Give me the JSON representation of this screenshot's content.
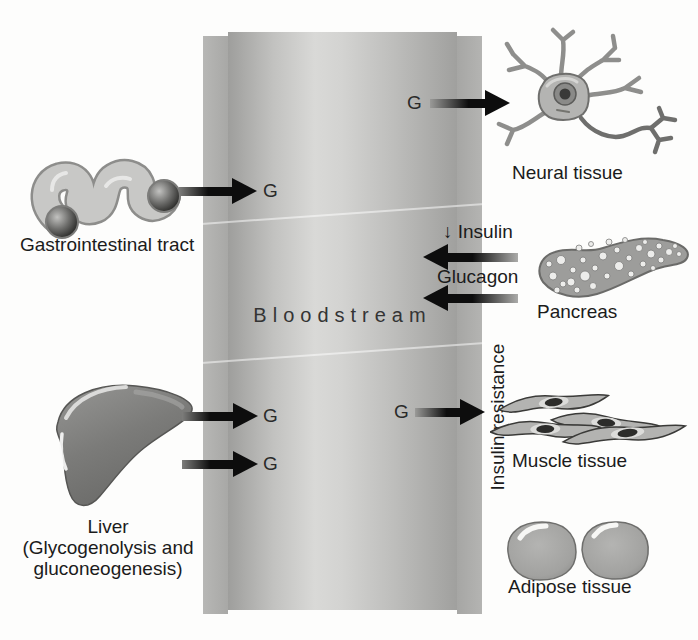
{
  "diagram": {
    "bloodstream_label": "Bloodstream",
    "glucose_symbol": "G",
    "organs": {
      "gi": "Gastrointestinal tract",
      "neural": "Neural tissue",
      "pancreas": "Pancreas",
      "liver_line1": "Liver",
      "liver_line2": "(Glycogenolysis and",
      "liver_line3": "gluconeogenesis)",
      "muscle": "Muscle tissue",
      "adipose": "Adipose tissue"
    },
    "hormones": {
      "insulin": "↓ Insulin",
      "glucagon": "Glucagon"
    },
    "annotations": {
      "insulin_resistance": "Insulin resistance"
    },
    "colors": {
      "vessel_wall": "#aeaeac",
      "vessel_edge": "#9e9e9c",
      "vessel_center": "#d9d9d7",
      "arrow": "#0d0d0d",
      "text": "#1b1b1b",
      "organ_gray": "#9d9d9b",
      "liver_gray": "#757573"
    }
  }
}
